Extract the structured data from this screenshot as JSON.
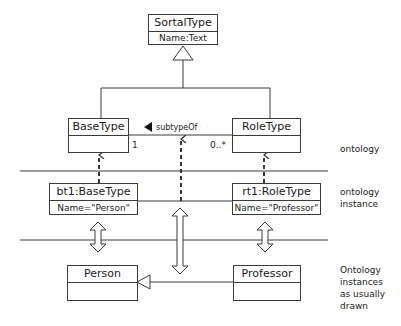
{
  "classes": {
    "sortal": {
      "name": "SortalType",
      "attr": "Name:Text"
    },
    "base": {
      "name": "BaseType"
    },
    "role": {
      "name": "RoleType"
    }
  },
  "association": {
    "label": "subtypeOf",
    "mult_left": "1",
    "mult_right": "0..*"
  },
  "instances": {
    "bt1": {
      "name": "bt1:BaseType",
      "attr": "Name=\"Person\""
    },
    "rt1": {
      "name": "rt1:RoleType",
      "attr": "Name=\"Professor\""
    }
  },
  "drawn": {
    "person": {
      "name": "Person"
    },
    "professor": {
      "name": "Professor"
    }
  },
  "layers": {
    "ontology": "ontology",
    "ontology_instance": [
      "ontology",
      "instance"
    ],
    "drawn": [
      "Ontology",
      "instances",
      "as usually",
      "drawn"
    ]
  },
  "colors": {
    "stroke": "#3a3a3a",
    "background": "#ffffff"
  }
}
